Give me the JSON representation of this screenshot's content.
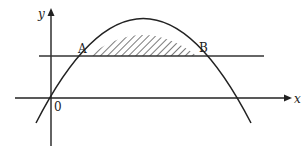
{
  "diagram": {
    "type": "parabola-line-region",
    "axes": {
      "x_label": "x",
      "y_label": "y",
      "origin_label": "0"
    },
    "points": [
      {
        "name": "A",
        "label": "A"
      },
      {
        "name": "B",
        "label": "B"
      }
    ],
    "curve": "downward parabola through origin",
    "line": "horizontal line intersecting parabola at A and B",
    "shaded_region": "region between parabola and line from A to B (hatched)",
    "colors": {
      "stroke": "#222222",
      "hatch": "#333333",
      "background": "#ffffff"
    }
  }
}
